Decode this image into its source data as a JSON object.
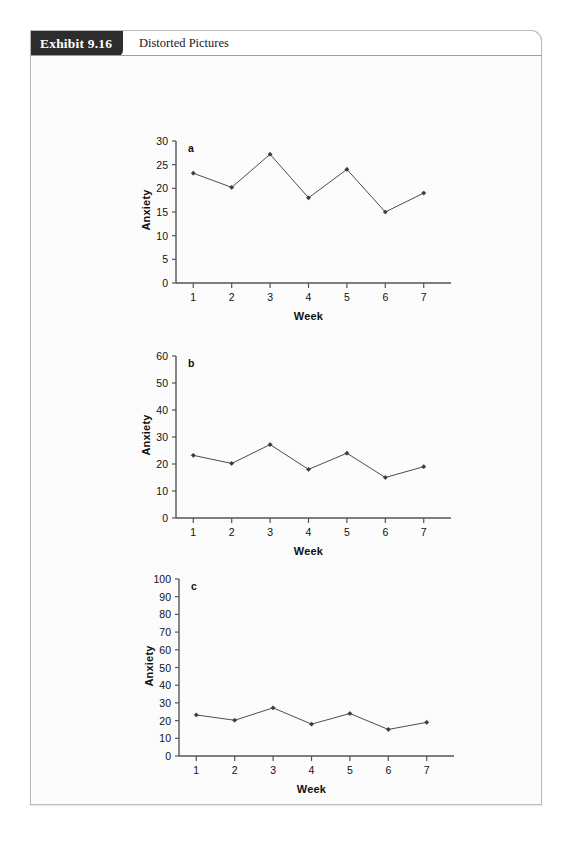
{
  "exhibit": {
    "number": "Exhibit 9.16",
    "caption": "Distorted Pictures"
  },
  "chart_data": [
    {
      "type": "line",
      "panel_label": "a",
      "title": "",
      "xlabel": "Week",
      "ylabel": "Anxiety",
      "categories": [
        1,
        2,
        3,
        4,
        5,
        6,
        7
      ],
      "x": [
        1,
        2,
        3,
        4,
        5,
        6,
        7
      ],
      "values": [
        23.2,
        20.2,
        27.2,
        18.0,
        24.0,
        15.0,
        19.0
      ],
      "xtick_labels": [
        "1",
        "2",
        "3",
        "4",
        "5",
        "6",
        "7"
      ],
      "ytick_labels": [
        "0",
        "5",
        "10",
        "15",
        "20",
        "25",
        "30"
      ],
      "yticks": [
        0,
        5,
        10,
        15,
        20,
        25,
        30
      ],
      "ylim": [
        0,
        30
      ],
      "xlim": [
        0.55,
        7.45
      ],
      "grid": false,
      "legend": "none",
      "line_color": "#4d4d4d",
      "marker_color": "#3a3a3a",
      "axis_color": "#555555"
    },
    {
      "type": "line",
      "panel_label": "b",
      "title": "",
      "xlabel": "Week",
      "ylabel": "Anxiety",
      "categories": [
        1,
        2,
        3,
        4,
        5,
        6,
        7
      ],
      "x": [
        1,
        2,
        3,
        4,
        5,
        6,
        7
      ],
      "values": [
        23.2,
        20.2,
        27.2,
        18.0,
        24.0,
        15.0,
        19.0
      ],
      "xtick_labels": [
        "1",
        "2",
        "3",
        "4",
        "5",
        "6",
        "7"
      ],
      "ytick_labels": [
        "0",
        "10",
        "20",
        "30",
        "40",
        "50",
        "60"
      ],
      "yticks": [
        0,
        10,
        20,
        30,
        40,
        50,
        60
      ],
      "ylim": [
        0,
        60
      ],
      "xlim": [
        0.55,
        7.45
      ],
      "grid": false,
      "legend": "none",
      "line_color": "#4d4d4d",
      "marker_color": "#3a3a3a",
      "axis_color": "#555555"
    },
    {
      "type": "line",
      "panel_label": "c",
      "title": "",
      "xlabel": "Week",
      "ylabel": "Anxiety",
      "categories": [
        1,
        2,
        3,
        4,
        5,
        6,
        7
      ],
      "x": [
        1,
        2,
        3,
        4,
        5,
        6,
        7
      ],
      "values": [
        23.2,
        20.2,
        27.2,
        18.0,
        24.0,
        15.0,
        19.0
      ],
      "xtick_labels": [
        "1",
        "2",
        "3",
        "4",
        "5",
        "6",
        "7"
      ],
      "ytick_labels": [
        "0",
        "10",
        "20",
        "30",
        "40",
        "50",
        "60",
        "70",
        "80",
        "90",
        "100"
      ],
      "yticks": [
        0,
        10,
        20,
        30,
        40,
        50,
        60,
        70,
        80,
        90,
        100
      ],
      "ylim": [
        0,
        100
      ],
      "xlim": [
        0.55,
        7.45
      ],
      "grid": false,
      "legend": "none",
      "line_color": "#4d4d4d",
      "marker_color": "#3a3a3a",
      "axis_color": "#555555"
    }
  ],
  "layout": {
    "panels": [
      {
        "top": 60,
        "plot_left": 145,
        "plot_top": 25,
        "plot_width": 265,
        "plot_height": 142
      },
      {
        "top": 265,
        "plot_left": 145,
        "plot_top": 35,
        "plot_width": 265,
        "plot_height": 162
      },
      {
        "top": 490,
        "plot_left": 148,
        "plot_top": 33,
        "plot_width": 265,
        "plot_height": 177
      }
    ]
  }
}
